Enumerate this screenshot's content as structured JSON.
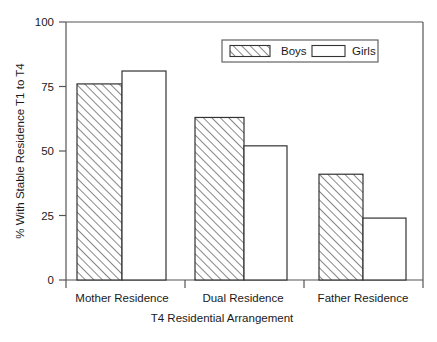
{
  "chart_data": {
    "type": "bar",
    "title": "",
    "xlabel": "T4 Residential Arrangement",
    "ylabel": "% With Stable Residence T1 to T4",
    "categories": [
      "Mother Residence",
      "Dual Residence",
      "Father Residence"
    ],
    "series": [
      {
        "name": "Boys",
        "values": [
          76,
          63,
          41
        ],
        "fill": "hatched",
        "color": "#ffffff"
      },
      {
        "name": "Girls",
        "values": [
          81,
          52,
          24
        ],
        "fill": "solid",
        "color": "#ffffff"
      }
    ],
    "ylim": [
      0,
      100
    ],
    "yticks": [
      0,
      25,
      50,
      75,
      100
    ],
    "ytick_labels": [
      "0",
      "25",
      "50",
      "75",
      "100"
    ],
    "grid": false,
    "legend_position": "top-right",
    "legend_entries": [
      "Boys",
      "Girls"
    ],
    "axis_color": "#555555",
    "bar_edge_color": "#333333"
  },
  "axes": {
    "y_tick_0": "0",
    "y_tick_25": "25",
    "y_tick_50": "50",
    "y_tick_75": "75",
    "y_tick_100": "100",
    "y_axis_title": "% With Stable Residence T1 to T4",
    "x_axis_title": "T4 Residential Arrangement",
    "x_cat_0": "Mother Residence",
    "x_cat_1": "Dual Residence",
    "x_cat_2": "Father Residence"
  },
  "legend": {
    "boys_label": "Boys",
    "girls_label": "Girls"
  }
}
